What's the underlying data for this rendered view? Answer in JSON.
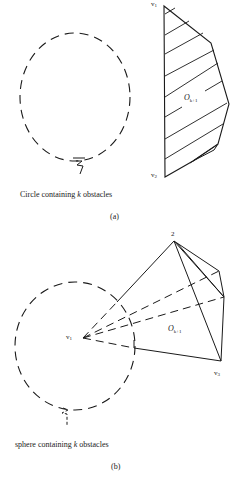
{
  "figure": {
    "panel_a": {
      "tag": "(a)",
      "caption_prefix": "Circle containing ",
      "caption_var": "k",
      "caption_suffix": " obstacles",
      "vertex_1": {
        "name": "v",
        "sub": "1"
      },
      "vertex_2": {
        "name": "v",
        "sub": "2"
      },
      "obstacle": {
        "name": "O",
        "sub": "k+1"
      },
      "center_mark": "ξ"
    },
    "panel_b": {
      "tag": "(b)",
      "caption_prefix": "sphere containing ",
      "caption_var": "k",
      "caption_suffix": " obstacles",
      "apex_label": "2",
      "vertex_1": {
        "name": "v",
        "sub": "1"
      },
      "vertex_3": {
        "name": "v",
        "sub": "3"
      },
      "obstacle": {
        "name": "O",
        "sub": "k+1"
      },
      "center_mark": "ξ"
    },
    "colors": {
      "ink": "#1a1a1a",
      "background": "#ffffff"
    }
  }
}
